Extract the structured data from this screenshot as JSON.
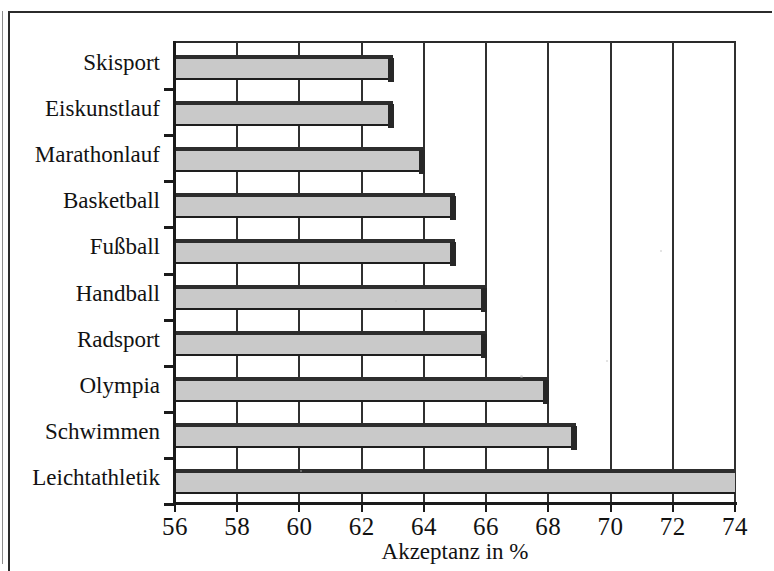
{
  "chart_data": {
    "type": "bar",
    "orientation": "horizontal",
    "title": "",
    "xlabel": "Akzeptanz in %",
    "ylabel": "",
    "xlim": [
      56,
      74
    ],
    "xticks": [
      56,
      58,
      60,
      62,
      64,
      66,
      68,
      70,
      72,
      74
    ],
    "xtick_labels": [
      "56",
      "58",
      "60",
      "62",
      "64",
      "66",
      "68",
      "70",
      "72",
      "74"
    ],
    "grid": true,
    "grid_axis": "x",
    "legend": null,
    "categories": [
      "Skisport",
      "Eiskunstlauf",
      "Marathonlauf",
      "Basketball",
      "Fußball",
      "Handball",
      "Radsport",
      "Olympia",
      "Schwimmen",
      "Leichtathletik"
    ],
    "values": [
      63.0,
      63.0,
      64.0,
      65.0,
      65.0,
      66.0,
      66.0,
      68.0,
      68.9,
      74.0
    ],
    "bar_face_color": "#c9c9c9",
    "bar_edge_color": "#1e1e1e",
    "axis_color": "#1a1a1a",
    "background_color": "#ffffff"
  },
  "axis": {
    "x_title": "Akzeptanz in %",
    "ticks": [
      "56",
      "58",
      "60",
      "62",
      "64",
      "66",
      "68",
      "70",
      "72",
      "74"
    ]
  },
  "categories": [
    {
      "label": "Skisport",
      "value": 63.0
    },
    {
      "label": "Eiskunstlauf",
      "value": 63.0
    },
    {
      "label": "Marathonlauf",
      "value": 64.0
    },
    {
      "label": "Basketball",
      "value": 65.0
    },
    {
      "label": "Fußball",
      "value": 65.0
    },
    {
      "label": "Handball",
      "value": 66.0
    },
    {
      "label": "Radsport",
      "value": 66.0
    },
    {
      "label": "Olympia",
      "value": 68.0
    },
    {
      "label": "Schwimmen",
      "value": 68.9
    },
    {
      "label": "Leichtathletik",
      "value": 74.0
    }
  ]
}
